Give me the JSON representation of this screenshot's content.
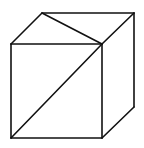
{
  "diagram": {
    "style": "line-drawing",
    "stroke_color": "#111111",
    "background": "#ffffff",
    "vertices": {
      "front_top_left": [
        11,
        44
      ],
      "front_top_right": [
        102,
        44
      ],
      "front_bottom_left": [
        11,
        138
      ],
      "front_bottom_right": [
        102,
        138
      ],
      "back_top_left": [
        42,
        13
      ],
      "back_top_right": [
        134,
        13
      ],
      "back_bottom_right": [
        134,
        107
      ]
    },
    "edges": [
      [
        "front_top_left",
        "front_top_right"
      ],
      [
        "front_top_right",
        "front_bottom_right"
      ],
      [
        "front_bottom_right",
        "front_bottom_left"
      ],
      [
        "front_bottom_left",
        "front_top_left"
      ],
      [
        "front_top_left",
        "back_top_left"
      ],
      [
        "back_top_left",
        "back_top_right"
      ],
      [
        "back_top_right",
        "front_top_right"
      ],
      [
        "back_top_right",
        "back_bottom_right"
      ],
      [
        "back_bottom_right",
        "front_bottom_right"
      ]
    ],
    "diagonals": [
      [
        "front_bottom_left",
        "front_top_right"
      ],
      [
        "back_top_left",
        "front_top_right"
      ]
    ]
  }
}
